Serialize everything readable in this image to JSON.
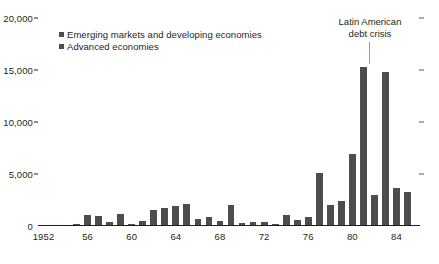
{
  "chart_data": {
    "type": "bar",
    "title": "",
    "subtitle": "",
    "xlabel": "",
    "ylabel": "",
    "ylim": [
      0,
      20000
    ],
    "yticks": [
      0,
      5000,
      10000,
      15000,
      20000
    ],
    "ytick_labels": [
      "0",
      "5,000",
      "10,000",
      "15,000",
      "20,000"
    ],
    "grid": false,
    "legend_position": "top-left",
    "categories": [
      "1952",
      "1953",
      "1954",
      "1955",
      "1956",
      "1957",
      "1958",
      "1959",
      "1960",
      "1961",
      "1962",
      "1963",
      "1964",
      "1965",
      "1966",
      "1967",
      "1968",
      "1969",
      "1970",
      "1971",
      "1972",
      "1973",
      "1974",
      "1975",
      "1976",
      "1977",
      "1978",
      "1979",
      "1980",
      "1981",
      "1982",
      "1983",
      "1984",
      "1985"
    ],
    "xtick_labels": [
      "1952",
      "56",
      "60",
      "64",
      "68",
      "72",
      "76",
      "80",
      "84"
    ],
    "xtick_categories": [
      "1952",
      "1956",
      "1960",
      "1964",
      "1968",
      "1972",
      "1976",
      "1980",
      "1984"
    ],
    "series": [
      {
        "name": "Emerging markets and developing economies",
        "color": "#4d4d4f",
        "values": [
          60,
          60,
          60,
          190,
          1100,
          1000,
          400,
          1150,
          200,
          450,
          1550,
          1750,
          1950,
          2150,
          700,
          900,
          500,
          2050,
          300,
          400,
          350,
          200,
          1100,
          600,
          900,
          5100,
          2000,
          2400,
          6900,
          15300,
          3000,
          14800,
          3700,
          3250
        ]
      }
    ],
    "legend": [
      {
        "label": "Emerging markets and developing economies",
        "color": "#4d4d4f"
      },
      {
        "label": "Advanced economies",
        "color": "#4d4d4f"
      }
    ],
    "annotations": [
      {
        "line1": "Latin American",
        "line2": "debt crisis",
        "points_to": "1981"
      }
    ]
  }
}
